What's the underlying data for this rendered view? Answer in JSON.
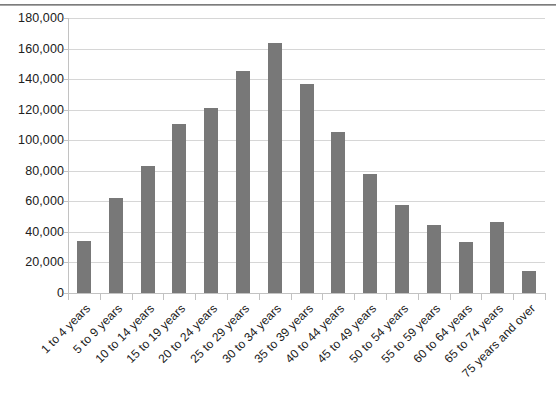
{
  "chart_data": {
    "type": "bar",
    "title": "",
    "subtitle": "",
    "xlabel": "",
    "ylabel": "",
    "legend": [],
    "legend_position": "none",
    "grid": true,
    "grid_axis": "y",
    "bar_color": "#787878",
    "gridline_color": "#d6d6d6",
    "axis_color": "#c2c2c2",
    "background_color": "#ffffff",
    "ylim": [
      0,
      180000
    ],
    "ytick_step": 20000,
    "ytick_labels": [
      "180,000",
      "160,000",
      "140,000",
      "120,000",
      "100,000",
      "80,000",
      "60,000",
      "40,000",
      "20,000",
      "0"
    ],
    "ytick_values": [
      180000,
      160000,
      140000,
      120000,
      100000,
      80000,
      60000,
      40000,
      20000,
      0
    ],
    "categories": [
      "1 to 4 years",
      "5 to 9 years",
      "10 to 14 years",
      "15 to 19 years",
      "20 to 24 years",
      "25 to 29 years",
      "30 to 34 years",
      "35 to 39 years",
      "40 to 44 years",
      "45 to 49 years",
      "50 to 54 years",
      "55 to 59 years",
      "60 to 64 years",
      "65 to 74 years",
      "75 years and over"
    ],
    "values": [
      34000,
      62500,
      83000,
      110500,
      121000,
      145500,
      163500,
      136500,
      105500,
      78000,
      57500,
      44500,
      33500,
      46500,
      14500
    ]
  }
}
